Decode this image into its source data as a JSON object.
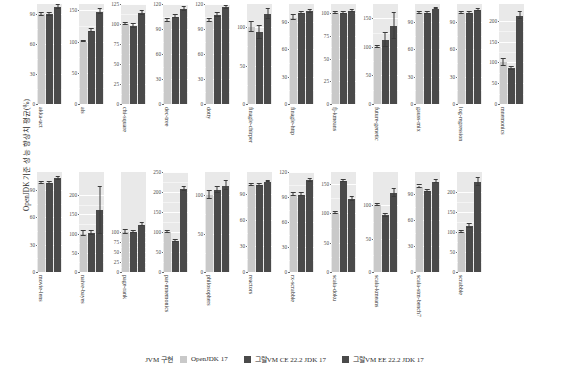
{
  "chart_data": {
    "type": "bar",
    "title": "",
    "ylabel": "OpenJDK 기준 성능 향상치 평균(%)",
    "xlabel": "",
    "grid": true,
    "legend_position": "bottom",
    "legend_title": "JVM 구현",
    "series": [
      {
        "name": "OpenJDK 17",
        "color": "#c9c9c9"
      },
      {
        "name": "그랄VM CE 22.2 JDK 17",
        "color": "#4a4a4a"
      },
      {
        "name": "그랄VM EE 22.2 JDK 17",
        "color": "#4a4a4a"
      }
    ],
    "panels": [
      {
        "category": "akka-uct",
        "ylim": [
          0,
          100
        ],
        "ticks": [
          0,
          30,
          60,
          90
        ],
        "values": [
          90,
          90,
          97
        ],
        "errors": [
          1.5,
          1.5,
          2.0
        ]
      },
      {
        "category": "als",
        "ylim": [
          0,
          160
        ],
        "ticks": [
          0,
          50,
          100,
          150
        ],
        "values": [
          100,
          117,
          148
        ],
        "errors": [
          1.5,
          2.5,
          4.0
        ]
      },
      {
        "category": "chi-square",
        "ylim": [
          0,
          125
        ],
        "ticks": [
          0,
          25,
          50,
          75,
          100,
          125
        ],
        "values": [
          100,
          97,
          114
        ],
        "errors": [
          1.5,
          2.5,
          2.5
        ]
      },
      {
        "category": "dec-tree",
        "ylim": [
          0,
          120
        ],
        "ticks": [
          0,
          30,
          60,
          90,
          120
        ],
        "values": [
          100,
          105,
          114
        ],
        "errors": [
          1.5,
          2.0,
          2.0
        ]
      },
      {
        "category": "dotty",
        "ylim": [
          0,
          120
        ],
        "ticks": [
          0,
          30,
          60,
          90,
          120
        ],
        "values": [
          100,
          107,
          116
        ],
        "errors": [
          1.5,
          2.0,
          2.0
        ]
      },
      {
        "category": "finagle-chirper",
        "ylim": [
          0,
          130
        ],
        "ticks": [
          0,
          50,
          100
        ],
        "values": [
          100,
          93,
          117
        ],
        "errors": [
          7.0,
          8.0,
          6.0
        ]
      },
      {
        "category": "finagle-http",
        "ylim": [
          0,
          110
        ],
        "ticks": [
          0,
          30,
          60,
          90
        ],
        "values": [
          95,
          100,
          102
        ],
        "errors": [
          3.0,
          1.5,
          1.5
        ]
      },
      {
        "category": "fj-kmeans",
        "ylim": [
          0,
          110
        ],
        "ticks": [
          0,
          25,
          50,
          75,
          100
        ],
        "values": [
          100,
          100,
          102
        ],
        "errors": [
          1.0,
          1.0,
          1.0
        ]
      },
      {
        "category": "future-genetic",
        "ylim": [
          0,
          175
        ],
        "ticks": [
          0,
          50,
          100,
          150
        ],
        "values": [
          100,
          112,
          137
        ],
        "errors": [
          1.5,
          12.0,
          23.0
        ]
      },
      {
        "category": "gauss-mix",
        "ylim": [
          0,
          110
        ],
        "ticks": [
          0,
          30,
          60,
          90
        ],
        "values": [
          100,
          100,
          105
        ],
        "errors": [
          1.0,
          1.0,
          1.0
        ]
      },
      {
        "category": "log-regression",
        "ylim": [
          0,
          110
        ],
        "ticks": [
          0,
          30,
          60,
          90
        ],
        "values": [
          100,
          100,
          103
        ],
        "errors": [
          1.0,
          1.0,
          1.0
        ]
      },
      {
        "category": "mnemonics",
        "ylim": [
          0,
          240
        ],
        "ticks": [
          0,
          50,
          100,
          150,
          200
        ],
        "values": [
          100,
          86,
          212
        ],
        "errors": [
          8.0,
          4.0,
          9.0
        ]
      },
      {
        "category": "movie-lens",
        "ylim": [
          0,
          110
        ],
        "ticks": [
          0,
          30,
          60,
          90
        ],
        "values": [
          98,
          98,
          103
        ],
        "errors": [
          1.0,
          1.5,
          1.5
        ]
      },
      {
        "category": "naive-bayes",
        "ylim": [
          0,
          260
        ],
        "ticks": [
          0,
          50,
          100,
          150,
          200
        ],
        "values": [
          100,
          101,
          160
        ],
        "errors": [
          7.0,
          6.0,
          62.0
        ]
      },
      {
        "category": "page-rank",
        "ylim": [
          0,
          250
        ],
        "ticks": [
          0,
          25,
          50,
          75,
          100
        ],
        "values": [
          100,
          100,
          118
        ],
        "errors": [
          6.0,
          3.0,
          4.0
        ]
      },
      {
        "category": "par-mnemonics",
        "ylim": [
          0,
          250
        ],
        "ticks": [
          0,
          50,
          100,
          150,
          200,
          250
        ],
        "values": [
          100,
          77,
          208
        ],
        "errors": [
          3.0,
          3.0,
          5.0
        ]
      },
      {
        "category": "philosophers",
        "ylim": [
          0,
          130
        ],
        "ticks": [
          0,
          50,
          100
        ],
        "values": [
          100,
          107,
          112
        ],
        "errors": [
          5.0,
          4.0,
          6.0
        ]
      },
      {
        "category": "reactors",
        "ylim": [
          0,
          115
        ],
        "ticks": [
          0,
          30,
          60,
          90
        ],
        "values": [
          100,
          100,
          104
        ],
        "errors": [
          1.0,
          1.0,
          1.0
        ]
      },
      {
        "category": "rx-scrabble",
        "ylim": [
          0,
          120
        ],
        "ticks": [
          0,
          30,
          60,
          90,
          120
        ],
        "values": [
          93,
          93,
          110
        ],
        "errors": [
          2.0,
          2.0,
          2.0
        ]
      },
      {
        "category": "scala-doku",
        "ylim": [
          0,
          170
        ],
        "ticks": [
          0,
          50,
          100,
          150
        ],
        "values": [
          100,
          155,
          124
        ],
        "errors": [
          1.5,
          2.0,
          4.0
        ]
      },
      {
        "category": "scala-kmeans",
        "ylim": [
          0,
          150
        ],
        "ticks": [
          0,
          50,
          100
        ],
        "values": [
          100,
          85,
          118
        ],
        "errors": [
          1.5,
          2.0,
          6.0
        ]
      },
      {
        "category": "scala-stm-bench7",
        "ylim": [
          0,
          115
        ],
        "ticks": [
          0,
          30,
          60,
          90
        ],
        "values": [
          98,
          93,
          104
        ],
        "errors": [
          1.5,
          1.5,
          2.0
        ]
      },
      {
        "category": "scrabble",
        "ylim": [
          0,
          250
        ],
        "ticks": [
          0,
          50,
          100,
          150,
          200
        ],
        "values": [
          100,
          115,
          225
        ],
        "errors": [
          3.0,
          5.0,
          10.0
        ]
      }
    ]
  }
}
